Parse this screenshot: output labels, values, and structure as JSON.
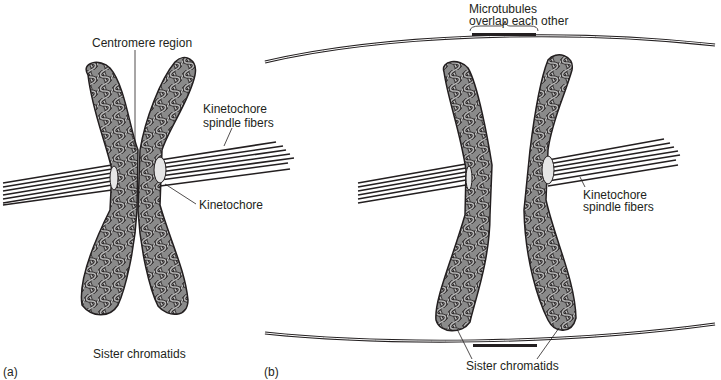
{
  "panel_a": {
    "tag": "(a)",
    "labels": {
      "centromere": "Centromere region",
      "spindle_line1": "Kinetochore",
      "spindle_line2": "spindle fibers",
      "kinetochore": "Kinetochore",
      "sister": "Sister chromatids"
    }
  },
  "panel_b": {
    "tag": "(b)",
    "labels": {
      "microtubules_line1": "Microtubules",
      "microtubules_line2": "overlap each other",
      "spindle_line1": "Kinetochore",
      "spindle_line2": "spindle fibers",
      "sister": "Sister chromatids"
    }
  },
  "colors": {
    "chromatid_fill": "#8a8a8a",
    "chromatid_loop": "#b5b5b5",
    "outline": "#231f20",
    "kinetochore": "#e6e6e6"
  }
}
